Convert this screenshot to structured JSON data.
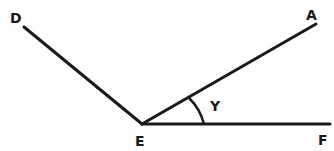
{
  "diagram": {
    "type": "angle-geometry",
    "points": {
      "D": {
        "label": "D",
        "x": 24,
        "y": 27
      },
      "A": {
        "label": "A",
        "x": 316,
        "y": 24
      },
      "E": {
        "label": "E",
        "x": 142,
        "y": 124
      },
      "F": {
        "label": "F",
        "x": 330,
        "y": 124
      }
    },
    "rays": [
      {
        "from": "E",
        "to": "D"
      },
      {
        "from": "E",
        "to": "A"
      },
      {
        "from": "E",
        "to": "F"
      }
    ],
    "angle_marker": {
      "label": "Y",
      "between": [
        "A",
        "F"
      ],
      "vertex": "E"
    },
    "colors": {
      "line": "#1a1a1a",
      "background": "#ffffff"
    }
  }
}
